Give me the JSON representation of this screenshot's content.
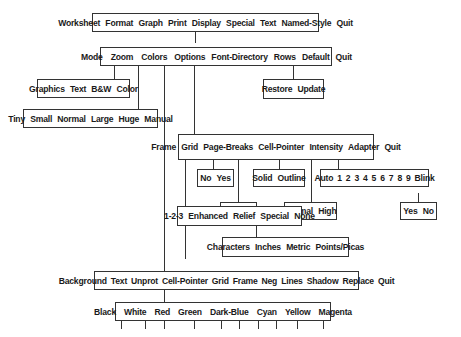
{
  "diagram": {
    "root_menu": {
      "items": [
        "Worksheet",
        "Format",
        "Graph",
        "Print",
        "Display",
        "Special",
        "Text",
        "Named-Style",
        "Quit"
      ]
    },
    "display_menu": {
      "items": [
        "Mode",
        "Zoom",
        "Colors",
        "Options",
        "Font-Directory",
        "Rows",
        "Default",
        "Quit"
      ]
    },
    "mode_submenu": {
      "items": [
        "Graphics",
        "Text",
        "B&W",
        "Color"
      ]
    },
    "zoom_submenu": {
      "items": [
        "Tiny",
        "Small",
        "Normal",
        "Large",
        "Huge",
        "Manual"
      ]
    },
    "default_submenu": {
      "items": [
        "Restore",
        "Update"
      ]
    },
    "options_menu": {
      "items": [
        "Frame",
        "Grid",
        "Page-Breaks",
        "Cell-Pointer",
        "Intensity",
        "Adapter",
        "Quit"
      ]
    },
    "grid_submenu": {
      "items": [
        "No",
        "Yes"
      ]
    },
    "page_breaks_submenu": {
      "items": [
        "Yes",
        "No"
      ]
    },
    "cell_pointer_submenu": {
      "items": [
        "Solid",
        "Outline"
      ]
    },
    "intensity_submenu": {
      "items": [
        "Normal",
        "High"
      ]
    },
    "adapter_submenu": {
      "items": [
        "Auto",
        "1",
        "2",
        "3",
        "4",
        "5",
        "6",
        "7",
        "8",
        "9",
        "Blink"
      ]
    },
    "blink_submenu": {
      "items": [
        "Yes",
        "No"
      ]
    },
    "frame_submenu": {
      "items": [
        "1-2-3",
        "Enhanced",
        "Relief",
        "Special",
        "None"
      ]
    },
    "special_submenu": {
      "items": [
        "Characters",
        "Inches",
        "Metric",
        "Points/Picas"
      ]
    },
    "colors_menu": {
      "items": [
        "Background",
        "Text",
        "Unprot",
        "Cell-Pointer",
        "Grid",
        "Frame",
        "Neg",
        "Lines",
        "Shadow",
        "Replace",
        "Quit"
      ]
    },
    "color_choices": {
      "items": [
        "Black",
        "White",
        "Red",
        "Green",
        "Dark-Blue",
        "Cyan",
        "Yellow",
        "Magenta"
      ]
    },
    "colors": {
      "line": "#333333",
      "box_border": "#333333",
      "text": "#1a1a1a",
      "background": "#ffffff"
    }
  }
}
